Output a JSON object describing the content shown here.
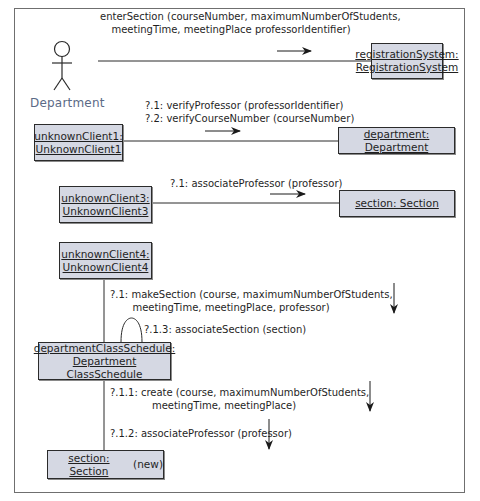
{
  "diagram": {
    "type": "UML collaboration diagram",
    "actor": {
      "label": "Department",
      "label_color": "#5b6a86"
    },
    "objects": {
      "registration_system": {
        "line1": "registrationSystem:",
        "line2": "RegistrationSystem"
      },
      "unknown_client1": {
        "line1": "unknownClient1:",
        "line2": "UnknownClient1"
      },
      "department": {
        "line1": "department: Department"
      },
      "unknown_client3": {
        "line1": "unknownClient3:",
        "line2": "UnknownClient3"
      },
      "section": {
        "line1": "section: Section"
      },
      "unknown_client4": {
        "line1": "unknownClient4:",
        "line2": "UnknownClient4"
      },
      "department_class_schedule": {
        "line1": "departmentClassSchedule:",
        "line2": "Department ClassSchedule"
      },
      "section_new": {
        "name": "section: Section",
        "suffix": " (new)"
      }
    },
    "messages": {
      "enter_section": {
        "line1": "enterSection (courseNumber, maximumNumberOfStudents,",
        "line2": "meetingTime, meetingPlace professorIdentifier)"
      },
      "verify": {
        "line1": "?.1: verifyProfessor (professorIdentifier)",
        "line2": "?.2: verifyCourseNumber (courseNumber)"
      },
      "associate_professor_1": {
        "line1": "?.1: associateProfessor (professor)"
      },
      "make_section": {
        "line1": "?.1: makeSection (course, maximumNumberOfStudents,",
        "line2": "meetingTime, meetingPlace, professor)"
      },
      "associate_section": {
        "line1": "?.1.3: associateSection (section)"
      },
      "create": {
        "line1": "?.1.1: create (course, maximumNumberOfStudents,",
        "line2": "meetingTime, meetingPlace)"
      },
      "associate_professor_2": {
        "line1": "?.1.2: associateProfessor (professor)"
      }
    },
    "colors": {
      "box_fill": "#d5d8e3",
      "box_border": "#2b2b2b",
      "frame_border": "#6f6f6f"
    }
  }
}
